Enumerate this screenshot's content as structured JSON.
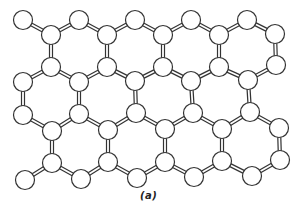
{
  "figure": {
    "caption": "(a)",
    "colors": {
      "background": "#ffffff",
      "atom_fill": "#ffffff",
      "atom_stroke": "#333333",
      "bond_outline": "#333333",
      "bond_core": "#ffffff"
    },
    "atom_radius": 9.5,
    "atoms": [
      {
        "id": "a1",
        "x": 23,
        "y": 20
      },
      {
        "id": "a2",
        "x": 79,
        "y": 20
      },
      {
        "id": "a3",
        "x": 135,
        "y": 20
      },
      {
        "id": "a4",
        "x": 191,
        "y": 20
      },
      {
        "id": "a5",
        "x": 247,
        "y": 20
      },
      {
        "id": "b1",
        "x": 51,
        "y": 35
      },
      {
        "id": "b2",
        "x": 107,
        "y": 35
      },
      {
        "id": "b3",
        "x": 163,
        "y": 35
      },
      {
        "id": "b4",
        "x": 219,
        "y": 35
      },
      {
        "id": "b5",
        "x": 275,
        "y": 34
      },
      {
        "id": "c1",
        "x": 51,
        "y": 67
      },
      {
        "id": "c2",
        "x": 107,
        "y": 67
      },
      {
        "id": "c3",
        "x": 163,
        "y": 67
      },
      {
        "id": "c4",
        "x": 219,
        "y": 67
      },
      {
        "id": "c5",
        "x": 276,
        "y": 65
      },
      {
        "id": "d1",
        "x": 23,
        "y": 82
      },
      {
        "id": "d2",
        "x": 79,
        "y": 82
      },
      {
        "id": "d3",
        "x": 135,
        "y": 81
      },
      {
        "id": "d4",
        "x": 191,
        "y": 81
      },
      {
        "id": "d5",
        "x": 248,
        "y": 80
      },
      {
        "id": "e1",
        "x": 23,
        "y": 115
      },
      {
        "id": "e2",
        "x": 79,
        "y": 114
      },
      {
        "id": "e3",
        "x": 136,
        "y": 113
      },
      {
        "id": "e4",
        "x": 193,
        "y": 113
      },
      {
        "id": "e5",
        "x": 250,
        "y": 112
      },
      {
        "id": "f1",
        "x": 52,
        "y": 131
      },
      {
        "id": "f2",
        "x": 108,
        "y": 130
      },
      {
        "id": "f3",
        "x": 165,
        "y": 129
      },
      {
        "id": "f4",
        "x": 222,
        "y": 129
      },
      {
        "id": "f5",
        "x": 279,
        "y": 128
      },
      {
        "id": "g1",
        "x": 52,
        "y": 163
      },
      {
        "id": "g2",
        "x": 108,
        "y": 162
      },
      {
        "id": "g3",
        "x": 165,
        "y": 162
      },
      {
        "id": "g4",
        "x": 222,
        "y": 161
      },
      {
        "id": "g5",
        "x": 280,
        "y": 160
      },
      {
        "id": "h1",
        "x": 25,
        "y": 180
      },
      {
        "id": "h2",
        "x": 81,
        "y": 179
      },
      {
        "id": "h3",
        "x": 137,
        "y": 178
      },
      {
        "id": "h4",
        "x": 194,
        "y": 177
      },
      {
        "id": "h5",
        "x": 252,
        "y": 176
      }
    ],
    "bonds": [
      [
        "a1",
        "b1"
      ],
      [
        "b1",
        "a2"
      ],
      [
        "a2",
        "b2"
      ],
      [
        "b2",
        "a3"
      ],
      [
        "a3",
        "b3"
      ],
      [
        "b3",
        "a4"
      ],
      [
        "a4",
        "b4"
      ],
      [
        "b4",
        "a5"
      ],
      [
        "a5",
        "b5"
      ],
      [
        "b1",
        "c1"
      ],
      [
        "b2",
        "c2"
      ],
      [
        "b3",
        "c3"
      ],
      [
        "b4",
        "c4"
      ],
      [
        "b5",
        "c5"
      ],
      [
        "d1",
        "c1"
      ],
      [
        "c1",
        "d2"
      ],
      [
        "d2",
        "c2"
      ],
      [
        "c2",
        "d3"
      ],
      [
        "d3",
        "c3"
      ],
      [
        "c3",
        "d4"
      ],
      [
        "d4",
        "c4"
      ],
      [
        "c4",
        "d5"
      ],
      [
        "d5",
        "c5"
      ],
      [
        "d1",
        "e1"
      ],
      [
        "d2",
        "e2"
      ],
      [
        "d3",
        "e3"
      ],
      [
        "d4",
        "e4"
      ],
      [
        "d5",
        "e5"
      ],
      [
        "e1",
        "f1"
      ],
      [
        "f1",
        "e2"
      ],
      [
        "e2",
        "f2"
      ],
      [
        "f2",
        "e3"
      ],
      [
        "e3",
        "f3"
      ],
      [
        "f3",
        "e4"
      ],
      [
        "e4",
        "f4"
      ],
      [
        "f4",
        "e5"
      ],
      [
        "e5",
        "f5"
      ],
      [
        "f1",
        "g1"
      ],
      [
        "f2",
        "g2"
      ],
      [
        "f3",
        "g3"
      ],
      [
        "f4",
        "g4"
      ],
      [
        "f5",
        "g5"
      ],
      [
        "h1",
        "g1"
      ],
      [
        "g1",
        "h2"
      ],
      [
        "h2",
        "g2"
      ],
      [
        "g2",
        "h3"
      ],
      [
        "h3",
        "g3"
      ],
      [
        "g3",
        "h4"
      ],
      [
        "h4",
        "g4"
      ],
      [
        "g4",
        "h5"
      ],
      [
        "h5",
        "g5"
      ]
    ]
  }
}
